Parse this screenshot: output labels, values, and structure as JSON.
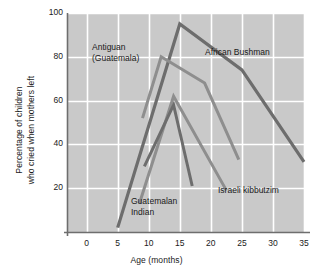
{
  "chart_data": {
    "type": "line",
    "title": "",
    "subtitle": "",
    "xlabel": "Age (months)",
    "ylabel": "Percentage of children who cried when mothers left",
    "ylabel_line1": "Percentage of children",
    "ylabel_line2": "who cried when mothers left",
    "xlim": [
      -3,
      35
    ],
    "ylim": [
      0,
      100
    ],
    "xticks": [
      0,
      5,
      10,
      15,
      20,
      25,
      30,
      35
    ],
    "yticks": [
      20,
      40,
      60,
      80,
      100
    ],
    "xtick_labels": [
      "0",
      "5",
      "10",
      "15",
      "20",
      "25",
      "30",
      "35"
    ],
    "ytick_labels": [
      "20",
      "40",
      "60",
      "80",
      "100"
    ],
    "grid": true,
    "grid_color": "#ffffff",
    "plot_background": "#c9c9c9",
    "axis_color": "#6e6e6e",
    "legend_position": "inline-annotations",
    "series": [
      {
        "name": "African Bushman",
        "color": "#6d6d6d",
        "width": 3.2,
        "x": [
          5,
          15,
          25,
          35
        ],
        "y": [
          2,
          95,
          74,
          32
        ]
      },
      {
        "name": "Antiguan (Guatemala)",
        "color": "#8e8e8e",
        "width": 3.0,
        "x": [
          9,
          12,
          19,
          24.5
        ],
        "y": [
          52,
          80,
          68,
          33
        ]
      },
      {
        "name": "Israeli kibbutzim",
        "color": "#8e8e8e",
        "width": 3.0,
        "x": [
          8.5,
          14,
          22.5
        ],
        "y": [
          13,
          62,
          19
        ]
      },
      {
        "name": "Guatemalan Indian",
        "color": "#6d6d6d",
        "width": 3.0,
        "x": [
          9.3,
          14,
          17
        ],
        "y": [
          30,
          58,
          21
        ]
      }
    ],
    "annotations": [
      {
        "text_line1": "Antiguan",
        "text_line2": "(Guatemala)",
        "x_px": 92,
        "y_px": 42
      },
      {
        "text_line1": "African Bushman",
        "text_line2": "",
        "x_px": 205,
        "y_px": 47
      },
      {
        "text_line1": "Israeli kibbutzim",
        "text_line2": "",
        "x_px": 218,
        "y_px": 185
      },
      {
        "text_line1": "Guatemalan",
        "text_line2": "Indian",
        "x_px": 131,
        "y_px": 196
      }
    ]
  }
}
